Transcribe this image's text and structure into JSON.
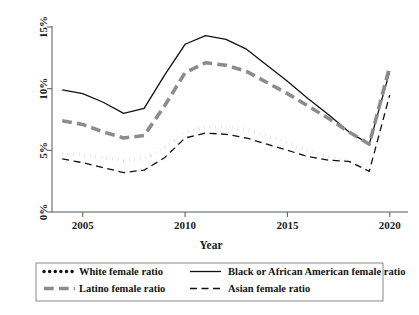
{
  "chart_data": {
    "type": "line",
    "title": "",
    "xlabel": "Year",
    "ylabel": "",
    "x": [
      2004,
      2005,
      2006,
      2007,
      2008,
      2009,
      2010,
      2011,
      2012,
      2013,
      2014,
      2015,
      2016,
      2017,
      2018,
      2019,
      2020
    ],
    "xlim": [
      2003.5,
      2020.5
    ],
    "ylim": [
      0,
      15
    ],
    "xticks": [
      2005,
      2010,
      2015,
      2020
    ],
    "xtick_labels": [
      "2005",
      "2010",
      "2015",
      "2020"
    ],
    "yticks": [
      0,
      5,
      10,
      15
    ],
    "ytick_labels": [
      "0%",
      "5%",
      "10%",
      "15%"
    ],
    "grid": false,
    "legend_position": "below",
    "series": [
      {
        "name": "White female ratio",
        "style": "dotted",
        "color": "#111111",
        "width": 3.4,
        "values": [
          4.7,
          4.6,
          4.4,
          4.2,
          4.3,
          5.2,
          6.5,
          6.9,
          6.9,
          6.7,
          6.2,
          5.6,
          5.0,
          4.5,
          4.1,
          3.7,
          8.1
        ]
      },
      {
        "name": "Black or African American female ratio",
        "style": "solid",
        "color": "#111111",
        "width": 1.3,
        "values": [
          9.9,
          9.6,
          8.9,
          8.0,
          8.4,
          11.1,
          13.6,
          14.3,
          14.0,
          13.2,
          11.9,
          10.6,
          9.2,
          7.9,
          6.5,
          5.5,
          11.4
        ]
      },
      {
        "name": "Latino female ratio",
        "style": "dashed-thick",
        "color": "#8c8c8c",
        "width": 3.6,
        "values": [
          7.4,
          7.1,
          6.5,
          6.0,
          6.2,
          8.6,
          11.3,
          12.1,
          11.9,
          11.4,
          10.5,
          9.6,
          8.6,
          7.6,
          6.5,
          5.5,
          11.8
        ]
      },
      {
        "name": "Asian female ratio",
        "style": "dashed-thin",
        "color": "#111111",
        "width": 1.3,
        "values": [
          4.3,
          4.0,
          3.6,
          3.2,
          3.4,
          4.4,
          6.0,
          6.4,
          6.3,
          6.0,
          5.5,
          5.0,
          4.5,
          4.2,
          4.1,
          3.3,
          9.5
        ]
      }
    ]
  },
  "legend": {
    "entries": [
      {
        "label": "White female ratio",
        "style": "dotted"
      },
      {
        "label": "Black or African American female ratio",
        "style": "solid"
      },
      {
        "label": "Latino female ratio",
        "style": "dashed-thick"
      },
      {
        "label": "Asian female ratio",
        "style": "dashed-thin"
      }
    ]
  }
}
